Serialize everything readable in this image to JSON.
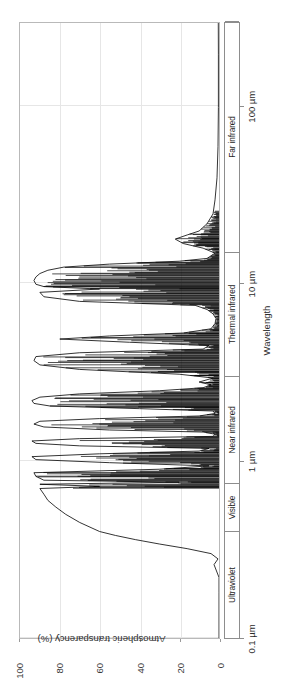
{
  "figure": {
    "rotation_note": "chart rendered rotated 90 degrees counter-clockwise",
    "background_color": "#ffffff",
    "curve_color": "#000000",
    "grid_color": "#e6e6e6",
    "frame_color": "#b9b9b9"
  },
  "chart_data": {
    "type": "line",
    "title": "",
    "xlabel": "Wavelength",
    "ylabel": "Atmospheric transparency (%)",
    "x_scale": "log",
    "xlim": [
      0.1,
      300
    ],
    "ylim": [
      0,
      100
    ],
    "grid": true,
    "legend": "none",
    "x_tick_labels": [
      "0.1 µm",
      "1 µm",
      "10 µm",
      "100 µm",
      "1 mm",
      "10 mm",
      "100 mm"
    ],
    "x_tick_values": [
      0.1,
      1,
      10,
      100,
      1000,
      10000,
      100000
    ],
    "y_tick_labels": [
      "0",
      "20",
      "40",
      "60",
      "80",
      "100"
    ],
    "y_tick_values": [
      0,
      20,
      40,
      60,
      80,
      100
    ],
    "bands": [
      {
        "label": "Ultraviolet",
        "from_um": 0.1,
        "to_um": 0.4
      },
      {
        "label": "Visible",
        "from_um": 0.4,
        "to_um": 0.75
      },
      {
        "label": "Near infrared",
        "from_um": 0.75,
        "to_um": 3.0
      },
      {
        "label": "Thermal infrared",
        "from_um": 3.0,
        "to_um": 15.0
      },
      {
        "label": "Far infrared",
        "from_um": 15.0,
        "to_um": 1000.0
      },
      {
        "label": "Microwave",
        "from_um": 1000.0,
        "to_um": 300000.0
      }
    ],
    "series": [
      {
        "name": "Atmospheric transparency",
        "description": "Transmittance of Earth's atmosphere versus wavelength; near zero in the ultraviolet, a broad optical/near-IR window with dense absorption lines, strong blocking through the far infrared, and a wide open microwave window above ~1 cm.",
        "points_um_percent": [
          [
            0.1,
            0.0
          ],
          [
            0.18,
            0.0
          ],
          [
            0.22,
            0.0
          ],
          [
            0.26,
            2.5
          ],
          [
            0.28,
            0.5
          ],
          [
            0.3,
            4.0
          ],
          [
            0.32,
            16.0
          ],
          [
            0.34,
            30.0
          ],
          [
            0.36,
            42.0
          ],
          [
            0.38,
            52.0
          ],
          [
            0.4,
            60.0
          ],
          [
            0.45,
            70.0
          ],
          [
            0.5,
            77.0
          ],
          [
            0.55,
            82.0
          ],
          [
            0.6,
            86.0
          ],
          [
            0.65,
            88.0
          ],
          [
            0.7,
            90.0
          ],
          [
            0.72,
            60.0
          ],
          [
            0.74,
            90.0
          ],
          [
            0.76,
            20.0
          ],
          [
            0.78,
            88.0
          ],
          [
            0.82,
            92.0
          ],
          [
            0.86,
            93.0
          ],
          [
            0.9,
            30.0
          ],
          [
            0.94,
            5.0
          ],
          [
            0.98,
            55.0
          ],
          [
            1.02,
            92.0
          ],
          [
            1.06,
            94.0
          ],
          [
            1.1,
            60.0
          ],
          [
            1.14,
            10.0
          ],
          [
            1.18,
            5.0
          ],
          [
            1.22,
            70.0
          ],
          [
            1.26,
            92.0
          ],
          [
            1.3,
            94.0
          ],
          [
            1.34,
            70.0
          ],
          [
            1.38,
            3.0
          ],
          [
            1.42,
            2.0
          ],
          [
            1.46,
            8.0
          ],
          [
            1.5,
            55.0
          ],
          [
            1.56,
            88.0
          ],
          [
            1.62,
            93.0
          ],
          [
            1.68,
            90.0
          ],
          [
            1.74,
            60.0
          ],
          [
            1.8,
            10.0
          ],
          [
            1.86,
            2.0
          ],
          [
            1.92,
            3.0
          ],
          [
            1.98,
            40.0
          ],
          [
            2.05,
            85.0
          ],
          [
            2.12,
            93.0
          ],
          [
            2.2,
            94.0
          ],
          [
            2.3,
            90.0
          ],
          [
            2.4,
            70.0
          ],
          [
            2.5,
            30.0
          ],
          [
            2.6,
            8.0
          ],
          [
            2.7,
            4.0
          ],
          [
            2.8,
            10.0
          ],
          [
            2.95,
            3.0
          ],
          [
            3.1,
            20.0
          ],
          [
            3.3,
            70.0
          ],
          [
            3.5,
            90.0
          ],
          [
            3.7,
            93.0
          ],
          [
            3.9,
            92.0
          ],
          [
            4.1,
            70.0
          ],
          [
            4.3,
            8.0
          ],
          [
            4.5,
            5.0
          ],
          [
            4.7,
            45.0
          ],
          [
            4.9,
            80.0
          ],
          [
            5.1,
            55.0
          ],
          [
            5.3,
            18.0
          ],
          [
            5.6,
            4.0
          ],
          [
            6.0,
            2.0
          ],
          [
            6.4,
            1.5
          ],
          [
            6.8,
            3.0
          ],
          [
            7.2,
            6.0
          ],
          [
            7.6,
            12.0
          ],
          [
            8.0,
            70.0
          ],
          [
            8.5,
            88.0
          ],
          [
            9.0,
            90.0
          ],
          [
            9.4,
            60.0
          ],
          [
            9.7,
            88.0
          ],
          [
            10.0,
            92.0
          ],
          [
            10.5,
            93.0
          ],
          [
            11.0,
            92.0
          ],
          [
            11.5,
            90.0
          ],
          [
            12.0,
            86.0
          ],
          [
            12.5,
            78.0
          ],
          [
            13.0,
            55.0
          ],
          [
            13.5,
            20.0
          ],
          [
            14.0,
            6.0
          ],
          [
            15.0,
            2.0
          ],
          [
            16.0,
            8.0
          ],
          [
            17.0,
            18.0
          ],
          [
            18.0,
            22.0
          ],
          [
            19.0,
            16.0
          ],
          [
            20.0,
            10.0
          ],
          [
            22.0,
            6.0
          ],
          [
            25.0,
            3.0
          ],
          [
            30.0,
            2.0
          ],
          [
            40.0,
            1.0
          ],
          [
            60.0,
            0.5
          ],
          [
            100.0,
            0.3
          ],
          [
            200.0,
            0.3
          ],
          [
            400.0,
            0.4
          ],
          [
            600.0,
            0.6
          ],
          [
            800.0,
            1.0
          ],
          [
            1000.0,
            2.0
          ],
          [
            1300.0,
            8.0
          ],
          [
            1600.0,
            18.0
          ],
          [
            2000.0,
            32.0
          ],
          [
            2500.0,
            48.0
          ],
          [
            3000.0,
            62.0
          ],
          [
            3500.0,
            72.0
          ],
          [
            4000.0,
            80.0
          ],
          [
            4600.0,
            86.0
          ],
          [
            5200.0,
            88.0
          ],
          [
            5800.0,
            86.0
          ],
          [
            6500.0,
            80.0
          ],
          [
            7200.0,
            70.0
          ],
          [
            8000.0,
            56.0
          ],
          [
            9000.0,
            40.0
          ],
          [
            10000.0,
            26.0
          ],
          [
            11500.0,
            16.0
          ],
          [
            13000.0,
            13.0
          ],
          [
            15000.0,
            14.0
          ],
          [
            17000.0,
            13.0
          ],
          [
            20000.0,
            9.0
          ],
          [
            25000.0,
            6.0
          ],
          [
            32000.0,
            4.0
          ],
          [
            45000.0,
            3.0
          ],
          [
            70000.0,
            2.5
          ],
          [
            120000.0,
            2.2
          ],
          [
            300000.0,
            2.0
          ]
        ],
        "absorption_lines_um": [
          0.718,
          0.762,
          0.822,
          0.905,
          0.935,
          1.12,
          1.15,
          1.38,
          1.41,
          1.45,
          1.83,
          1.88,
          1.92,
          2.01,
          2.05,
          2.58,
          2.65,
          2.72,
          2.78,
          2.93,
          3.05,
          3.2,
          4.25,
          4.4,
          4.55,
          5.25,
          5.5,
          5.8,
          6.05,
          6.3,
          6.55,
          6.8,
          7.1,
          7.35,
          7.65,
          9.45,
          9.65,
          13.2,
          13.6,
          14.1,
          14.6,
          15.2,
          15.8,
          16.5,
          17.2,
          18.1,
          19.2,
          20.5,
          22.0,
          24.0
        ]
      }
    ]
  }
}
